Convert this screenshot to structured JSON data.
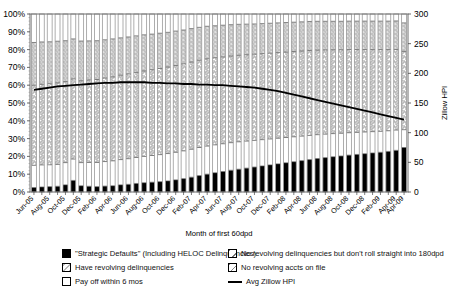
{
  "chart_data": {
    "type": "bar",
    "stacked": true,
    "title": "",
    "xlabel": "Month of first 60dpd",
    "ylabel": "",
    "ylabel_right": "Zillow HPI",
    "ylim": [
      0,
      1
    ],
    "ylim_right": [
      0,
      300
    ],
    "yticks": [
      "0%",
      "10%",
      "20%",
      "30%",
      "40%",
      "50%",
      "60%",
      "70%",
      "80%",
      "90%",
      "100%"
    ],
    "yticks_right": [
      "0",
      "50",
      "100",
      "150",
      "200",
      "250",
      "300"
    ],
    "grid": false,
    "legend_position": "bottom",
    "categories": [
      "Jun-05",
      "Jul-05",
      "Aug-05",
      "Sep-05",
      "Oct-05",
      "Nov-05",
      "Dec-05",
      "Jan-06",
      "Feb-06",
      "Mar-06",
      "Apr-06",
      "May-06",
      "Jun-06",
      "Jul-06",
      "Aug-06",
      "Sep-06",
      "Oct-06",
      "Nov-06",
      "Dec-06",
      "Jan-07",
      "Feb-07",
      "Mar-07",
      "Apr-07",
      "May-07",
      "Jun-07",
      "Jul-07",
      "Aug-07",
      "Sep-07",
      "Oct-07",
      "Nov-07",
      "Dec-07",
      "Jan-08",
      "Feb-08",
      "Mar-08",
      "Apr-08",
      "May-08",
      "Jun-08",
      "Jul-08",
      "Aug-08",
      "Sep-08",
      "Oct-08",
      "Nov-08",
      "Dec-08",
      "Jan-09",
      "Feb-09",
      "Mar-09",
      "Apr-09",
      "Apr-09"
    ],
    "tick_labels": [
      "Jun-05",
      "",
      "Aug-05",
      "",
      "Oct-05",
      "",
      "Dec-05",
      "",
      "Feb-06",
      "",
      "Apr-06",
      "",
      "Jun-06",
      "",
      "Aug-06",
      "",
      "Oct-06",
      "",
      "Dec-06",
      "",
      "Feb-07",
      "",
      "Apr-07",
      "",
      "Jun-07",
      "",
      "Aug-07",
      "",
      "Oct-07",
      "",
      "Dec-07",
      "",
      "Feb-08",
      "",
      "Apr-08",
      "",
      "Jun-08",
      "",
      "Aug-08",
      "",
      "Oct-08",
      "",
      "Dec-08",
      "",
      "Feb-09",
      "",
      "Apr-09",
      "Apr-09"
    ],
    "series": [
      {
        "name": "\"Strategic Defaults\" (Including HELOC Delinquencies)",
        "pattern": "solid-black",
        "color": "#000000",
        "values": [
          2.5,
          2.8,
          3.0,
          3.2,
          4.0,
          6.5,
          3.5,
          3.2,
          3.0,
          3.3,
          3.5,
          4.0,
          4.3,
          4.8,
          5.2,
          5.5,
          5.8,
          6.2,
          6.8,
          7.5,
          8.3,
          9.2,
          10.0,
          10.8,
          11.5,
          12.2,
          12.8,
          13.4,
          14.0,
          14.6,
          15.2,
          15.8,
          16.4,
          17.0,
          17.6,
          18.2,
          18.8,
          19.3,
          19.8,
          20.2,
          20.7,
          21.1,
          21.5,
          21.9,
          22.3,
          22.8,
          23.4,
          25.0
        ]
      },
      {
        "name": "No revolving delinquencies but don't roll straight into 180dpd",
        "pattern": "white-dash",
        "color": "#f2f2f2",
        "values": [
          12.5,
          12.4,
          12.3,
          12.3,
          12.5,
          12.0,
          13.0,
          13.4,
          13.6,
          13.8,
          14.0,
          14.2,
          14.4,
          14.6,
          14.8,
          15.0,
          15.2,
          15.4,
          15.5,
          15.6,
          15.7,
          15.8,
          15.8,
          15.7,
          15.6,
          15.5,
          15.4,
          15.2,
          15.0,
          14.8,
          14.6,
          14.4,
          14.2,
          14.0,
          13.8,
          13.6,
          13.4,
          13.2,
          13.0,
          12.8,
          12.6,
          12.4,
          12.2,
          12.0,
          11.8,
          11.6,
          11.4,
          10.0
        ]
      },
      {
        "name": "Have revolving delinquencies",
        "pattern": "diag-hatch",
        "color": "#e9e9e9",
        "values": [
          45.0,
          45.3,
          45.5,
          45.8,
          45.5,
          45.0,
          46.0,
          46.3,
          46.6,
          46.9,
          47.2,
          47.4,
          47.6,
          47.8,
          48.0,
          48.2,
          48.4,
          48.6,
          48.8,
          48.9,
          49.0,
          49.0,
          49.0,
          48.9,
          48.8,
          48.7,
          48.6,
          48.5,
          48.4,
          48.3,
          48.2,
          48.1,
          48.0,
          47.9,
          47.8,
          47.7,
          47.5,
          47.3,
          47.1,
          46.9,
          46.7,
          46.5,
          46.3,
          46.1,
          45.9,
          45.6,
          45.3,
          44.0
        ]
      },
      {
        "name": "No revolving accts on file",
        "pattern": "cross-hatch",
        "color": "#dcdcdc",
        "values": [
          24.0,
          23.8,
          23.6,
          23.4,
          23.0,
          22.5,
          22.3,
          22.0,
          21.8,
          21.5,
          21.3,
          21.0,
          20.8,
          20.5,
          20.3,
          20.0,
          19.8,
          19.5,
          19.3,
          19.0,
          18.8,
          18.5,
          18.3,
          18.0,
          17.8,
          17.6,
          17.4,
          17.2,
          17.0,
          16.9,
          16.8,
          16.7,
          16.6,
          16.5,
          16.4,
          16.3,
          16.2,
          16.1,
          16.0,
          16.0,
          16.0,
          16.0,
          16.0,
          16.0,
          16.0,
          16.0,
          16.0,
          16.0
        ]
      },
      {
        "name": "Pay off within 6 mos",
        "pattern": "white",
        "color": "#ffffff",
        "values": [
          16.0,
          15.7,
          15.6,
          15.3,
          15.0,
          14.0,
          15.2,
          15.1,
          15.0,
          14.5,
          14.0,
          13.4,
          12.9,
          12.3,
          11.7,
          11.3,
          10.8,
          10.3,
          9.6,
          9.0,
          8.2,
          7.5,
          6.9,
          6.6,
          6.3,
          6.0,
          5.8,
          5.7,
          5.6,
          5.4,
          5.2,
          5.0,
          4.8,
          4.6,
          4.4,
          4.2,
          4.1,
          4.1,
          4.1,
          4.1,
          4.0,
          4.0,
          4.0,
          4.0,
          4.0,
          4.0,
          3.9,
          5.0
        ]
      }
    ],
    "line_series": {
      "name": "Avg Zillow HPI",
      "color": "#000000",
      "axis": "right",
      "values": [
        172,
        174,
        176,
        178,
        179,
        180,
        181,
        182,
        183,
        184,
        184,
        185,
        185,
        185,
        185,
        184,
        184,
        183,
        183,
        182,
        182,
        181,
        181,
        180,
        180,
        179,
        178,
        177,
        176,
        174,
        172,
        170,
        167,
        164,
        161,
        158,
        155,
        152,
        149,
        146,
        143,
        140,
        137,
        134,
        131,
        128,
        125,
        122
      ]
    }
  },
  "legend": {
    "items": [
      {
        "label": "\"Strategic Defaults\" (Including HELOC Delinquencies)",
        "swatch": "solid-black"
      },
      {
        "label": "Have revolving delinquencies",
        "swatch": "diag-hatch"
      },
      {
        "label": "Pay off within 6 mos",
        "swatch": "white"
      },
      {
        "label": "No revolving delinquencies but don't roll straight into 180dpd",
        "swatch": "white-dash"
      },
      {
        "label": "No revolving accts on file",
        "swatch": "cross-hatch"
      },
      {
        "label": "Avg Zillow HPI",
        "swatch": "line"
      }
    ]
  }
}
